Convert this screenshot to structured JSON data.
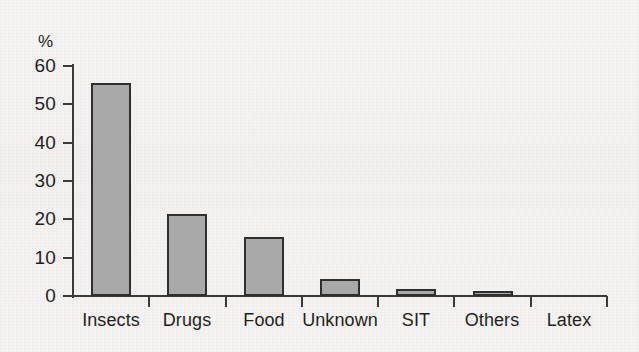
{
  "chart_data": {
    "type": "bar",
    "title": "",
    "subtitle": "",
    "xlabel": "",
    "ylabel": "%",
    "categories": [
      "Insects",
      "Drugs",
      "Food",
      "Unknown",
      "SIT",
      "Others",
      "Latex"
    ],
    "values": [
      55.5,
      21.5,
      15.5,
      4.5,
      1.8,
      1.2,
      0
    ],
    "ylim": [
      0,
      60
    ],
    "ytick_labels": [
      "60",
      "50",
      "40",
      "30",
      "20",
      "10",
      "0"
    ],
    "ytick_values": [
      60,
      50,
      40,
      30,
      20,
      10,
      0
    ],
    "grid": false,
    "legend": null,
    "bar_fill_color": "#a9a9a9",
    "bar_border_color": "#2f2f2f",
    "axis_color": "#3b3b3b",
    "background_color": "#f4f3f1",
    "text_color": "#231f20"
  },
  "axis": {
    "unit_label": "%"
  }
}
